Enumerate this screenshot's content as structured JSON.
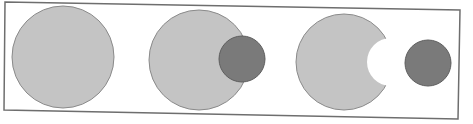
{
  "diagram": {
    "colors": {
      "background": "#ffffff",
      "frame": "#6e6e6e",
      "large_circle": "#c4c4c4",
      "small_circle": "#7a7a7a",
      "outline": "#8a8a8a"
    },
    "panels": [
      {
        "id": "whole",
        "large": {
          "cx": 63,
          "cy": 57,
          "r": 51
        }
      },
      {
        "id": "overlap",
        "large": {
          "cx": 199,
          "cy": 60,
          "r": 50
        },
        "small": {
          "cx": 242,
          "cy": 59,
          "r": 23
        }
      },
      {
        "id": "subtracted",
        "large": {
          "cx": 344,
          "cy": 62,
          "r": 48
        },
        "bite": {
          "cx": 391,
          "cy": 62,
          "r": 24
        },
        "small": {
          "cx": 428,
          "cy": 63,
          "r": 23
        }
      }
    ]
  }
}
